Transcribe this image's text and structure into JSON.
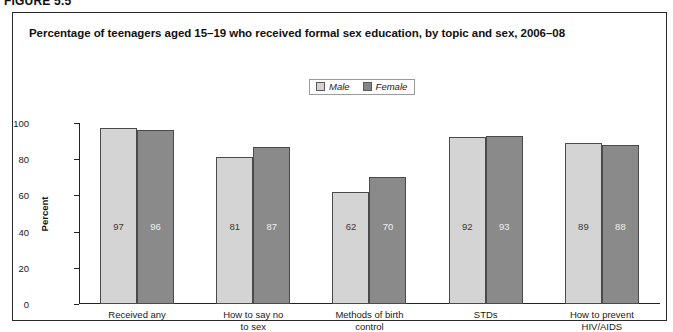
{
  "figure": {
    "label": "FIGURE 5.5"
  },
  "chart_data": {
    "type": "bar",
    "title": "Percentage of teenagers aged 15–19 who received formal sex education, by topic and sex, 2006–08",
    "xlabel": "",
    "ylabel": "Percent",
    "ylim": [
      0,
      100
    ],
    "yticks": [
      0,
      20,
      40,
      60,
      80,
      100
    ],
    "grid": false,
    "legend_position": "top-center",
    "categories": [
      "Received any",
      "How to say no to sex",
      "Methods of birth control",
      "STDs",
      "How to prevent HIV/AIDS"
    ],
    "category_lines": [
      [
        "Received any"
      ],
      [
        "How to say no",
        "to sex"
      ],
      [
        "Methods of birth",
        "control"
      ],
      [
        "STDs"
      ],
      [
        "How to prevent",
        "HIV/AIDS"
      ]
    ],
    "series": [
      {
        "name": "Male",
        "color": "#d4d4d4",
        "values": [
          97,
          81,
          62,
          92,
          89
        ]
      },
      {
        "name": "Female",
        "color": "#8a8a8a",
        "values": [
          96,
          87,
          70,
          93,
          88
        ]
      }
    ]
  }
}
